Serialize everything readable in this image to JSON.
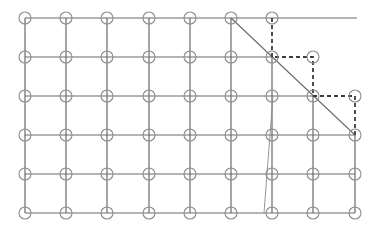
{
  "diagram": {
    "type": "grid-path-diagram",
    "colors": {
      "grid_line": "#6a6a6a",
      "dashed_path": "#3c3c3c",
      "node_stroke": "#8c8c8c",
      "background": "#ffffff"
    },
    "columns_x": [
      25,
      66,
      107,
      149,
      190,
      231,
      272,
      313,
      355
    ],
    "rows_y": [
      18,
      57,
      96,
      135,
      174,
      213
    ],
    "node_radius": 6,
    "nodes": [
      [
        0,
        0
      ],
      [
        1,
        0
      ],
      [
        2,
        0
      ],
      [
        3,
        0
      ],
      [
        4,
        0
      ],
      [
        5,
        0
      ],
      [
        6,
        0
      ],
      [
        0,
        1
      ],
      [
        1,
        1
      ],
      [
        2,
        1
      ],
      [
        3,
        1
      ],
      [
        4,
        1
      ],
      [
        5,
        1
      ],
      [
        6,
        1
      ],
      [
        7,
        1
      ],
      [
        0,
        2
      ],
      [
        1,
        2
      ],
      [
        2,
        2
      ],
      [
        3,
        2
      ],
      [
        4,
        2
      ],
      [
        5,
        2
      ],
      [
        6,
        2
      ],
      [
        7,
        2
      ],
      [
        8,
        2
      ],
      [
        0,
        3
      ],
      [
        1,
        3
      ],
      [
        2,
        3
      ],
      [
        3,
        3
      ],
      [
        4,
        3
      ],
      [
        5,
        3
      ],
      [
        6,
        3
      ],
      [
        7,
        3
      ],
      [
        8,
        3
      ],
      [
        0,
        4
      ],
      [
        1,
        4
      ],
      [
        2,
        4
      ],
      [
        3,
        4
      ],
      [
        4,
        4
      ],
      [
        5,
        4
      ],
      [
        6,
        4
      ],
      [
        7,
        4
      ],
      [
        8,
        4
      ],
      [
        0,
        5
      ],
      [
        1,
        5
      ],
      [
        2,
        5
      ],
      [
        3,
        5
      ],
      [
        4,
        5
      ],
      [
        5,
        5
      ],
      [
        6,
        5
      ],
      [
        7,
        5
      ],
      [
        8,
        5
      ]
    ],
    "solid_segments": [
      [
        25,
        18,
        357,
        18
      ],
      [
        25,
        57,
        272,
        57
      ],
      [
        25,
        96,
        313,
        96
      ],
      [
        25,
        135,
        355,
        135
      ],
      [
        25,
        174,
        355,
        174
      ],
      [
        25,
        213,
        355,
        213
      ],
      [
        25,
        18,
        25,
        213
      ],
      [
        66,
        18,
        66,
        213
      ],
      [
        107,
        18,
        107,
        213
      ],
      [
        149,
        18,
        149,
        213
      ],
      [
        190,
        18,
        190,
        213
      ],
      [
        231,
        18,
        231,
        213
      ],
      [
        272,
        57,
        272,
        213
      ],
      [
        313,
        96,
        313,
        213
      ],
      [
        355,
        135,
        355,
        213
      ]
    ],
    "dashed_path": [
      [
        272,
        18
      ],
      [
        272,
        57
      ],
      [
        313,
        57
      ],
      [
        313,
        96
      ],
      [
        355,
        96
      ],
      [
        355,
        135
      ]
    ],
    "diagonal_line": [
      231,
      18,
      355,
      135
    ],
    "thin_slanted_line": [
      273,
      96,
      264,
      213
    ]
  }
}
